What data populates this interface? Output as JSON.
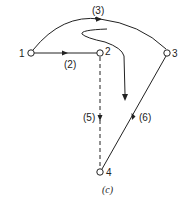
{
  "diagram": {
    "caption": "(c)",
    "nodes": [
      {
        "id": "1",
        "label": "1"
      },
      {
        "id": "2",
        "label": "2"
      },
      {
        "id": "3",
        "label": "3"
      },
      {
        "id": "4",
        "label": "4"
      }
    ],
    "edges": [
      {
        "id": "2",
        "label": "(2)",
        "from": "1",
        "to": "2",
        "style": "solid"
      },
      {
        "id": "3",
        "label": "(3)",
        "from": "1",
        "to": "3",
        "style": "solid-arc"
      },
      {
        "id": "5",
        "label": "(5)",
        "from": "2",
        "to": "4",
        "style": "dashed"
      },
      {
        "id": "6",
        "label": "(6)",
        "from": "3",
        "to": "4",
        "style": "solid"
      }
    ],
    "colors": {
      "stroke": "#222222",
      "background": "#ffffff"
    }
  }
}
